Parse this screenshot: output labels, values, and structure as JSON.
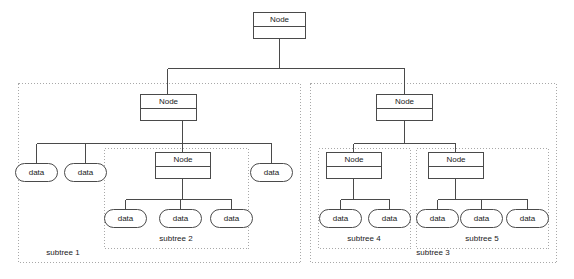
{
  "diagram": {
    "type": "tree-structure-diagram",
    "background_color": "#ffffff",
    "node_border_color": "#4a4a4a",
    "subtree_border_color": "#a8a8a8",
    "text_color": "#1a1a1a",
    "node_label": "Node",
    "data_label": "data",
    "nodes": {
      "root": {
        "label": "Node",
        "x": 253,
        "y": 12,
        "w": 52,
        "h": 26
      },
      "left_child": {
        "label": "Node",
        "x": 140,
        "y": 94,
        "w": 56,
        "h": 26
      },
      "right_child": {
        "label": "Node",
        "x": 376,
        "y": 94,
        "w": 56,
        "h": 26
      },
      "subtree2_node": {
        "label": "Node",
        "x": 155,
        "y": 152,
        "w": 55,
        "h": 26
      },
      "subtree4_node": {
        "label": "Node",
        "x": 326,
        "y": 152,
        "w": 55,
        "h": 26
      },
      "subtree5_node": {
        "label": "Node",
        "x": 428,
        "y": 152,
        "w": 55,
        "h": 26
      }
    },
    "data_leaves": [
      {
        "label": "data",
        "cx": 36,
        "cy": 172,
        "group": "subtree1"
      },
      {
        "label": "data",
        "cx": 85,
        "cy": 172,
        "group": "subtree1"
      },
      {
        "label": "data",
        "cx": 271,
        "cy": 172,
        "group": "subtree1"
      },
      {
        "label": "data",
        "cx": 125,
        "cy": 218,
        "group": "subtree2"
      },
      {
        "label": "data",
        "cx": 180,
        "cy": 218,
        "group": "subtree2"
      },
      {
        "label": "data",
        "cx": 231,
        "cy": 218,
        "group": "subtree2"
      },
      {
        "label": "data",
        "cx": 340,
        "cy": 218,
        "group": "subtree4"
      },
      {
        "label": "data",
        "cx": 389,
        "cy": 218,
        "group": "subtree4"
      },
      {
        "label": "data",
        "cx": 437,
        "cy": 218,
        "group": "subtree5"
      },
      {
        "label": "data",
        "cx": 481,
        "cy": 218,
        "group": "subtree5"
      },
      {
        "label": "data",
        "cx": 527,
        "cy": 218,
        "group": "subtree5"
      }
    ],
    "subtrees": [
      {
        "id": "subtree1",
        "label": "subtree 1",
        "x": 18,
        "y": 83,
        "w": 282,
        "h": 179,
        "label_x": 63,
        "label_y": 253
      },
      {
        "id": "subtree2",
        "label": "subtree 2",
        "x": 104,
        "y": 148,
        "w": 144,
        "h": 100,
        "label_x": 176,
        "label_y": 239
      },
      {
        "id": "subtree3",
        "label": "subtree 3",
        "x": 310,
        "y": 83,
        "w": 246,
        "h": 179,
        "label_x": 433,
        "label_y": 253
      },
      {
        "id": "subtree4",
        "label": "subtree 4",
        "x": 318,
        "y": 148,
        "w": 92,
        "h": 100,
        "label_x": 364,
        "label_y": 239
      },
      {
        "id": "subtree5",
        "label": "subtree 5",
        "x": 416,
        "y": 148,
        "w": 132,
        "h": 100,
        "label_x": 482,
        "label_y": 239
      }
    ],
    "oval": {
      "w": 42,
      "h": 18,
      "rx": 9
    }
  }
}
